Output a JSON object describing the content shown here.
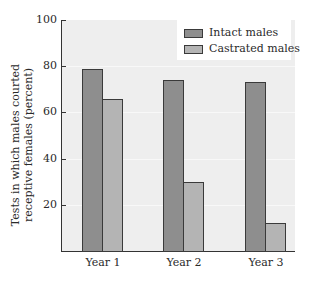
{
  "chart_data": {
    "type": "bar",
    "title": "",
    "xlabel": "",
    "ylabel": "Tests in which males courted receptive females (percent)",
    "ylabel_lines": [
      "Tests in which males courted",
      "receptive females (percent)"
    ],
    "categories": [
      "Year 1",
      "Year 2",
      "Year 3"
    ],
    "series": [
      {
        "name": "Intact males",
        "values": [
          79,
          74,
          73
        ],
        "color": "#8e8e8e"
      },
      {
        "name": "Castrated males",
        "values": [
          66,
          30,
          12
        ],
        "color": "#b4b4b4"
      }
    ],
    "ylim": [
      0,
      100
    ],
    "yticks": [
      20,
      40,
      60,
      80,
      100
    ],
    "grid": true,
    "legend_position": "top-right"
  }
}
